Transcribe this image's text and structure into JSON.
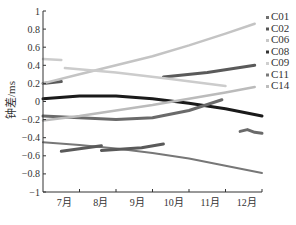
{
  "chart_data": {
    "type": "line",
    "title": "",
    "xlabel": "",
    "ylabel": "钟差/ms",
    "ylim": [
      -1,
      1
    ],
    "yticks": [
      1,
      0.8,
      0.6,
      0.4,
      0.2,
      0,
      -0.2,
      -0.4,
      -0.6,
      -0.8,
      -1
    ],
    "ytick_labels": [
      "1",
      "0.8",
      "0.6",
      "0.4",
      "0.2",
      "0",
      "−0.2",
      "−0.4",
      "−0.6",
      "−0.8",
      "−1"
    ],
    "xlim": [
      0,
      6
    ],
    "x_unit": "months since start of July (approx.)",
    "xtick_labels": [
      "7月",
      "8月",
      "9月",
      "10月",
      "11月",
      "12月"
    ],
    "grid": false,
    "legend_position": "right-outside-top",
    "legend": [
      {
        "name": "C01",
        "color": "#707070"
      },
      {
        "name": "C02",
        "color": "#555555"
      },
      {
        "name": "C06",
        "color": "#c8c8c8"
      },
      {
        "name": "C08",
        "color": "#333333"
      },
      {
        "name": "C09",
        "color": "#cfcfcf"
      },
      {
        "name": "C11",
        "color": "#7a7a7a"
      },
      {
        "name": "C14",
        "color": "#bdbdbd"
      }
    ],
    "series": [
      {
        "name": "C01",
        "color": "#777777",
        "width": 2,
        "segments": [
          {
            "x": [
              0.0,
              1.0,
              2.0,
              3.0,
              4.0,
              5.0,
              6.0
            ],
            "y": [
              -0.45,
              -0.48,
              -0.52,
              -0.57,
              -0.63,
              -0.71,
              -0.79
            ]
          }
        ]
      },
      {
        "name": "C02",
        "color": "#5a5a5a",
        "width": 3,
        "segments": [
          {
            "x": [
              0.0,
              0.5
            ],
            "y": [
              0.2,
              0.22
            ]
          },
          {
            "x": [
              3.3,
              4.5,
              5.8
            ],
            "y": [
              0.27,
              0.32,
              0.4
            ]
          },
          {
            "x": [
              0.5,
              1.6
            ],
            "y": [
              -0.55,
              -0.49
            ]
          },
          {
            "x": [
              1.6,
              2.7,
              3.3
            ],
            "y": [
              -0.54,
              -0.51,
              -0.47
            ]
          }
        ]
      },
      {
        "name": "C06",
        "color": "#c4c4c4",
        "width": 2.5,
        "segments": [
          {
            "x": [
              0.0,
              1.0,
              2.0,
              3.0,
              4.0,
              5.0,
              5.8
            ],
            "y": [
              0.2,
              0.3,
              0.4,
              0.5,
              0.62,
              0.75,
              0.86
            ]
          }
        ]
      },
      {
        "name": "C08",
        "color": "#1a1a1a",
        "width": 3,
        "segments": [
          {
            "x": [
              0.0,
              1.0,
              2.0,
              3.0,
              4.0,
              5.0,
              6.0
            ],
            "y": [
              0.03,
              0.06,
              0.06,
              0.03,
              -0.02,
              -0.08,
              -0.16
            ]
          }
        ]
      },
      {
        "name": "C09",
        "color": "#cccccc",
        "width": 2.5,
        "segments": [
          {
            "x": [
              0.0,
              0.5
            ],
            "y": [
              0.47,
              0.46
            ]
          },
          {
            "x": [
              0.6,
              2.0,
              3.5,
              5.0
            ],
            "y": [
              0.37,
              0.32,
              0.25,
              0.17
            ]
          }
        ]
      },
      {
        "name": "C11",
        "color": "#6a6a6a",
        "width": 3,
        "segments": [
          {
            "x": [
              0.0,
              1.0,
              2.0,
              3.0,
              4.0,
              4.9
            ],
            "y": [
              -0.16,
              -0.18,
              -0.2,
              -0.18,
              -0.1,
              0.02
            ]
          },
          {
            "x": [
              5.4,
              5.6,
              5.8,
              6.0
            ],
            "y": [
              -0.33,
              -0.31,
              -0.34,
              -0.35
            ]
          }
        ]
      },
      {
        "name": "C14",
        "color": "#bbbbbb",
        "width": 2.5,
        "segments": [
          {
            "x": [
              0.0,
              1.0,
              2.0,
              3.0,
              4.0,
              5.0,
              5.8
            ],
            "y": [
              -0.21,
              -0.16,
              -0.1,
              -0.04,
              0.03,
              0.1,
              0.16
            ]
          }
        ]
      }
    ]
  }
}
